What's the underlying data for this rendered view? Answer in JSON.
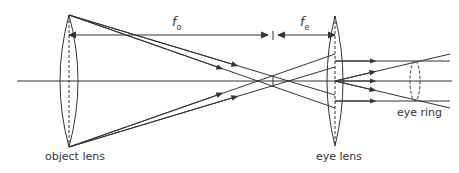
{
  "diagram": {
    "labels": {
      "object_lens": "object lens",
      "eye_lens": "eye lens",
      "eye_ring": "eye ring"
    },
    "dimensions": {
      "objective_focal": {
        "symbol": "f",
        "subscript": "o"
      },
      "eyepiece_focal": {
        "symbol": "f",
        "subscript": "e"
      }
    },
    "colors": {
      "line": "#333333",
      "background": "#ffffff"
    }
  }
}
